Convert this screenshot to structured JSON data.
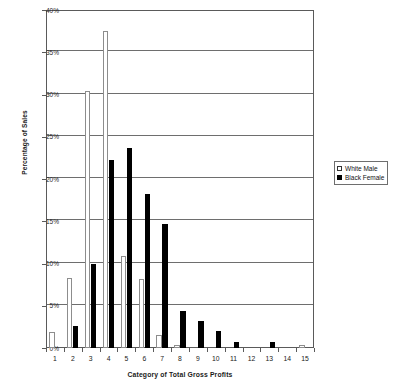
{
  "chart_data": {
    "type": "bar",
    "title": "",
    "xlabel": "Category of Total Gross Profits",
    "ylabel": "Percentage of Sales",
    "categories": [
      "1",
      "2",
      "3",
      "4",
      "5",
      "6",
      "7",
      "8",
      "9",
      "10",
      "11",
      "12",
      "13",
      "14",
      "15"
    ],
    "ylim": [
      0,
      40
    ],
    "ytick_labels": [
      "0%",
      "5%",
      "10%",
      "15%",
      "20%",
      "25%",
      "30%",
      "35%",
      "40%"
    ],
    "ytick_values": [
      0,
      5,
      10,
      15,
      20,
      25,
      30,
      35,
      40
    ],
    "grid": true,
    "legend_position": "right",
    "series": [
      {
        "name": "White Male",
        "color": "#ffffff",
        "edge_color": "#8d8d8d",
        "values": [
          1.9,
          8.3,
          30.4,
          37.5,
          10.9,
          8.2,
          1.5,
          0.35,
          0,
          0,
          0,
          0,
          0,
          0,
          0.4
        ]
      },
      {
        "name": "Black Female",
        "color": "#000000",
        "edge_color": "#000000",
        "values": [
          0,
          2.6,
          9.9,
          22.3,
          23.7,
          18.2,
          14.7,
          4.4,
          3.2,
          2.0,
          0.7,
          0,
          0.7,
          0,
          0
        ]
      }
    ]
  },
  "legend": {
    "items": [
      {
        "label": "White Male",
        "swatch": "white-square-icon"
      },
      {
        "label": "Black Female",
        "swatch": "black-square-icon"
      }
    ]
  }
}
